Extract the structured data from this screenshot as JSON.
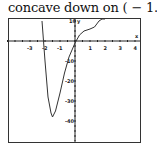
{
  "title": "concave down on ( − 1.5, 1)",
  "chart_data": {
    "type": "line",
    "title": "concave down on ( − 1.5, 1)",
    "xlabel": "x",
    "ylabel": "y",
    "xlim": [
      -4.5,
      4.3
    ],
    "ylim": [
      -50,
      10
    ],
    "grid": false,
    "x_ticks": [
      -3,
      -2,
      -1,
      1,
      2,
      3,
      4
    ],
    "y_ticks": [
      10,
      -10,
      -20,
      -30,
      -40
    ],
    "series": [
      {
        "name": "f(x)",
        "x": [
          -2.2,
          -2.0,
          -1.8,
          -1.6,
          -1.5,
          -1.3,
          -1.0,
          -0.7,
          -0.4,
          0.0,
          0.3,
          0.6,
          1.0,
          1.3,
          1.6,
          1.8,
          2.0
        ],
        "y": [
          10,
          -10,
          -28,
          -36,
          -38,
          -35,
          -26,
          -16,
          -8,
          -1,
          3,
          5,
          6,
          7,
          10,
          14,
          20
        ]
      }
    ]
  }
}
